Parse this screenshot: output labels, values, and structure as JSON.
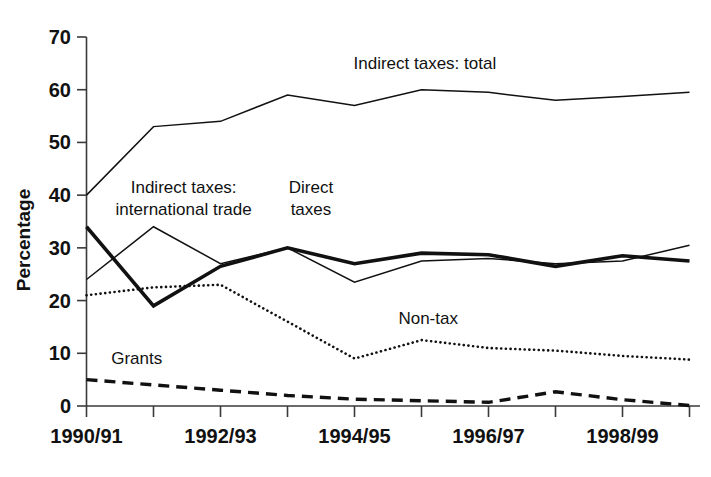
{
  "chart_data": {
    "type": "line",
    "title": "",
    "xlabel": "",
    "ylabel": "Percentage",
    "ylim": [
      0,
      70
    ],
    "ytick_values": [
      0,
      10,
      20,
      30,
      40,
      50,
      60,
      70
    ],
    "ytick_labels": [
      "0",
      "10",
      "20",
      "30",
      "40",
      "50",
      "60",
      "70"
    ],
    "grid": false,
    "legend": "inline-annotations",
    "categories": [
      "1990/91",
      "1991/92",
      "1992/93",
      "1993/94",
      "1994/95",
      "1995/96",
      "1996/97",
      "1997/98",
      "1998/99",
      "1999/00"
    ],
    "xtick_labels_shown": [
      {
        "index": 0,
        "label": "1990/91"
      },
      {
        "index": 2,
        "label": "1992/93"
      },
      {
        "index": 4,
        "label": "1994/95"
      },
      {
        "index": 6,
        "label": "1996/97"
      },
      {
        "index": 8,
        "label": "1998/99"
      }
    ],
    "series": [
      {
        "name": "Indirect taxes: total",
        "style": "solid-thin",
        "stroke_width": 1.5,
        "dasharray": "none",
        "label_x_index": 5.05,
        "label_y_value": 64.0,
        "label_anchor": "middle",
        "values": [
          40.0,
          53.0,
          54.0,
          59.0,
          57.0,
          60.0,
          59.5,
          58.0,
          58.7,
          59.5
        ]
      },
      {
        "name": "Indirect taxes: international trade",
        "style": "solid-thin",
        "stroke_width": 1.5,
        "dasharray": "none",
        "label_line1": "Indirect taxes:",
        "label_line2": "international trade",
        "label_x_index": 1.45,
        "label_y_value": 40.5,
        "label_anchor": "middle",
        "values": [
          24.0,
          34.0,
          27.0,
          30.0,
          23.5,
          27.5,
          28.0,
          27.0,
          27.5,
          30.5
        ]
      },
      {
        "name": "Direct taxes",
        "style": "solid-thick",
        "stroke_width": 3.6,
        "dasharray": "none",
        "label_line1": "Direct",
        "label_line2": "taxes",
        "label_x_index": 3.35,
        "label_y_value": 40.5,
        "label_anchor": "middle",
        "values": [
          34.0,
          19.0,
          26.5,
          30.0,
          27.0,
          29.0,
          28.7,
          26.5,
          28.5,
          27.5
        ]
      },
      {
        "name": "Non-tax",
        "style": "dotted",
        "stroke_width": 2.6,
        "dasharray": "0.1,4.6",
        "label_x_index": 5.1,
        "label_y_value": 15.5,
        "label_anchor": "middle",
        "values": [
          21.0,
          22.5,
          23.0,
          16.0,
          9.0,
          12.5,
          11.0,
          10.5,
          9.5,
          8.8
        ]
      },
      {
        "name": "Grants",
        "style": "dashed",
        "stroke_width": 3.4,
        "dasharray": "11,7",
        "label_x_index": 0.75,
        "label_y_value": 8.0,
        "label_anchor": "middle",
        "values": [
          5.0,
          4.0,
          3.0,
          2.0,
          1.3,
          1.0,
          0.7,
          2.7,
          1.2,
          0.1
        ]
      }
    ]
  },
  "colors": {
    "ink": "#111111",
    "axis": "#3a3a3a",
    "background": "#ffffff"
  }
}
